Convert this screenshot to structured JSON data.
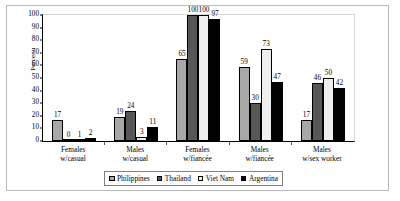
{
  "chart_data": {
    "type": "bar",
    "title": "",
    "xlabel": "",
    "ylabel": "Percent",
    "ylim": [
      0,
      100
    ],
    "yticks": [
      0,
      10,
      20,
      30,
      40,
      50,
      60,
      70,
      80,
      90,
      100
    ],
    "grid": false,
    "legend_position": "bottom",
    "categories": [
      "Females\nw/casual",
      "Males\nw/casual",
      "Females\nw/fiancée",
      "Males\nw/fiancée",
      "Males\nw/sex worker"
    ],
    "series": [
      {
        "name": "Philippines",
        "values": [
          17,
          19,
          65,
          59,
          17
        ],
        "color": "#a8a8a8"
      },
      {
        "name": "Thailand",
        "values": [
          0,
          24,
          100,
          30,
          46
        ],
        "color": "#575757"
      },
      {
        "name": "Viet Nam",
        "values": [
          1,
          3,
          100,
          73,
          50
        ],
        "color": "#efefef"
      },
      {
        "name": "Argentina",
        "values": [
          2,
          11,
          97,
          47,
          42
        ],
        "color": "#000000"
      }
    ]
  },
  "axis": {
    "y_label": "Percent",
    "y_ticks": [
      "0",
      "10",
      "20",
      "30",
      "40",
      "50",
      "60",
      "70",
      "80",
      "90",
      "100"
    ]
  },
  "categories": [
    {
      "line1": "Females",
      "line2": "w/casual"
    },
    {
      "line1": "Males",
      "line2": "w/casual"
    },
    {
      "line1": "Females",
      "line2": "w/fiancée"
    },
    {
      "line1": "Males",
      "line2": "w/fiancée"
    },
    {
      "line1": "Males",
      "line2": "w/sex worker"
    }
  ],
  "legend": {
    "items": [
      {
        "label": "Philippines",
        "color": "#a8a8a8"
      },
      {
        "label": "Thailand",
        "color": "#575757"
      },
      {
        "label": "Viet Nam",
        "color": "#efefef"
      },
      {
        "label": "Argentina",
        "color": "#000000"
      }
    ]
  }
}
